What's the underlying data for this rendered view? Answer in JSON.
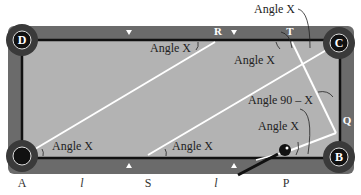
{
  "colors": {
    "rail": "#6b6b6b",
    "cloth": "#b3b3b3",
    "cushion_line": "#111111",
    "pocket_outer": "#3a3a3a",
    "pocket_inner": "#111111",
    "path_line": "#ffffff",
    "ball": "#111111",
    "cue": "#111111"
  },
  "pockets": {
    "top_left": "D",
    "top_right": "C",
    "bottom_left": "A",
    "bottom_right": "B"
  },
  "rail_points": {
    "top": [
      "R",
      "T"
    ],
    "right": [
      "Q"
    ]
  },
  "annotations": {
    "angle_top_left": "Angle X",
    "angle_top_right_upper": "Angle X",
    "angle_top_right_lower": "Angle X",
    "angle_right": "Angle 90 – X",
    "angle_bottom_right": "Angle X",
    "angle_bottom_left": "Angle X",
    "angle_bottom_middle": "Angle X"
  },
  "bottom_labels": [
    "A",
    "l",
    "S",
    "l",
    "P"
  ]
}
